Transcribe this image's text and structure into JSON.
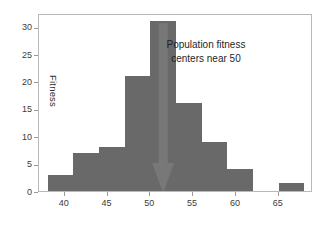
{
  "chart_data": {
    "type": "bar",
    "title": "",
    "subtitle": "",
    "xlabel": "",
    "ylabel": "Fitness",
    "xlim": [
      37.0,
      69.0
    ],
    "ylim": [
      0,
      32.5
    ],
    "grid": false,
    "legend": null,
    "bin_width": 3,
    "categories": [
      "38",
      "41",
      "44",
      "47",
      "50",
      "53",
      "56",
      "59",
      "62",
      "65"
    ],
    "bin_starts": [
      38,
      41,
      44,
      47,
      50,
      53,
      56,
      59,
      62,
      65
    ],
    "values": [
      3,
      7,
      8,
      21,
      31,
      16,
      9,
      4,
      0,
      1.5
    ],
    "bars": [
      {
        "x0": 38,
        "x1": 41,
        "height": 3
      },
      {
        "x0": 41,
        "x1": 44,
        "height": 7
      },
      {
        "x0": 44,
        "x1": 47,
        "height": 8
      },
      {
        "x0": 47,
        "x1": 50,
        "height": 21
      },
      {
        "x0": 50,
        "x1": 53,
        "height": 31
      },
      {
        "x0": 53,
        "x1": 56,
        "height": 16
      },
      {
        "x0": 56,
        "x1": 59,
        "height": 9
      },
      {
        "x0": 59,
        "x1": 62,
        "height": 4
      },
      {
        "x0": 65,
        "x1": 68,
        "height": 1.5
      }
    ],
    "xticks": [
      40,
      45,
      50,
      55,
      60,
      65
    ],
    "xtick_labels": [
      "40",
      "45",
      "50",
      "55",
      "60",
      "65"
    ],
    "yticks": [
      0,
      5,
      10,
      15,
      20,
      25,
      30
    ],
    "ytick_labels": [
      "0",
      "5",
      "10",
      "15",
      "20",
      "25",
      "30"
    ],
    "annotations": [
      {
        "name": "population-fitness-note",
        "lines": [
          "Population fitness",
          "centers near 50"
        ],
        "line1": "Population fitness",
        "line2": "centers near 50",
        "x": 56.5,
        "y": 27
      },
      {
        "name": "down-arrow-marker",
        "kind": "arrow",
        "direction": "down",
        "x": 51.5,
        "y_from": 31,
        "y_to": 0
      }
    ],
    "colors": {
      "bar": "#696969",
      "arrow": "#787878",
      "axis": "#b9b9b9",
      "tick_text": "#3b3b3b",
      "annotation_text": "#1f1f1f",
      "background": "#ffffff"
    }
  }
}
